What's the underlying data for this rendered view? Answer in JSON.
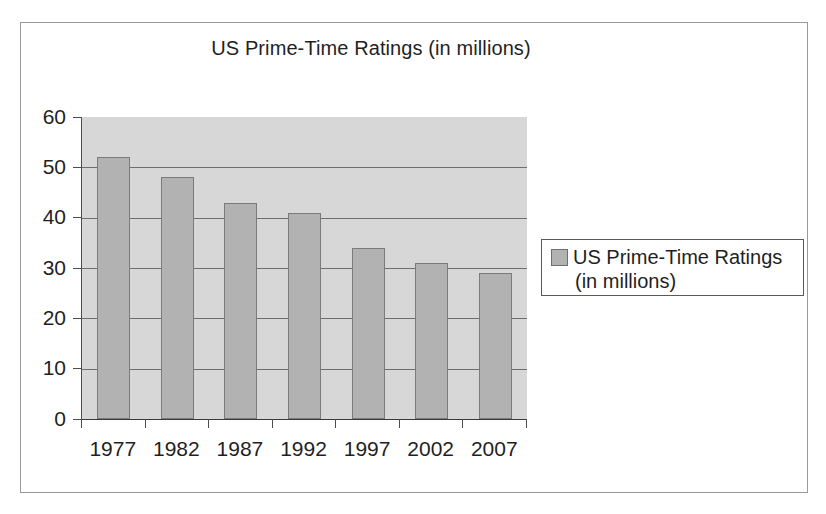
{
  "chart_data": {
    "type": "bar",
    "title": "US Prime-Time Ratings (in millions)",
    "categories": [
      "1977",
      "1982",
      "1987",
      "1992",
      "1997",
      "2002",
      "2007"
    ],
    "values": [
      52,
      48,
      43,
      41,
      34,
      31,
      29
    ],
    "series": [
      {
        "name": "US Prime-Time Ratings (in millions)",
        "values": [
          52,
          48,
          43,
          41,
          34,
          31,
          29
        ]
      }
    ],
    "xlabel": "",
    "ylabel": "",
    "ylim": [
      0,
      60
    ],
    "yticks": [
      "0",
      "10",
      "20",
      "30",
      "40",
      "50",
      "60"
    ],
    "grid": true,
    "legend_position": "right",
    "legend_entries": [
      {
        "label_line1": "US Prime-Time Ratings",
        "label_line2": "(in millions)",
        "color": "#b2b2b2"
      }
    ],
    "colors": {
      "bar_fill": "#b2b2b2",
      "bar_border": "#7b7b7b",
      "plot_background": "#d7d7d7",
      "gridline": "#6e6e6e",
      "axis": "#3a3a3a",
      "text": "#1f1f1f",
      "frame_border": "#9a9a9a"
    }
  }
}
